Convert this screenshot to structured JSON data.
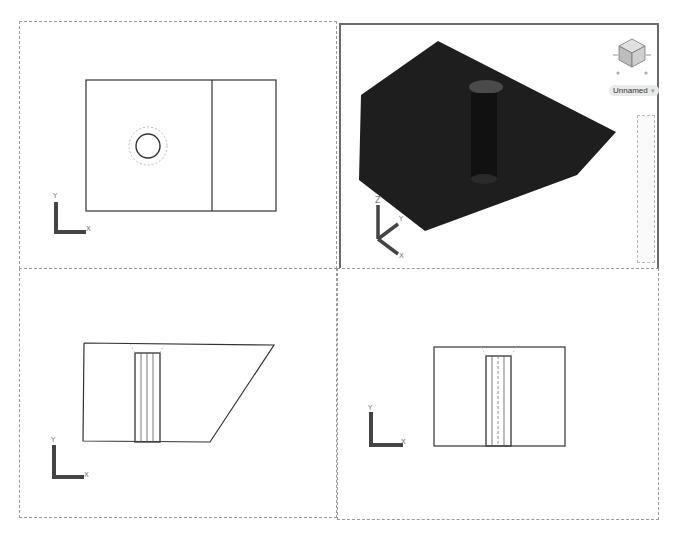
{
  "viewports": [
    {
      "id": "top",
      "view": "Top",
      "ucs_axes": [
        "X",
        "Y"
      ],
      "active": false
    },
    {
      "id": "sw-isometric",
      "view": "SW Isometric",
      "ucs_axes": [
        "X",
        "Y",
        "Z"
      ],
      "active": true,
      "visual_style": "shaded",
      "solid_color": "#1e1e1e"
    },
    {
      "id": "front",
      "view": "Front",
      "ucs_axes": [
        "X",
        "Y"
      ],
      "active": false
    },
    {
      "id": "right",
      "view": "Right",
      "ucs_axes": [
        "X",
        "Y"
      ],
      "active": false
    }
  ],
  "viewcube": {
    "ucs_label": "Unnamed",
    "dropdown_icon": "chevron-down-icon"
  },
  "axis_labels": {
    "x": "X",
    "y": "Y",
    "z": "Z"
  },
  "colors": {
    "border": "#9a9a9a",
    "active_border": "#6b6b6b",
    "geometry": "#333333",
    "hidden_lines": "#aaaaaa",
    "solid": "#1e1e1e"
  }
}
